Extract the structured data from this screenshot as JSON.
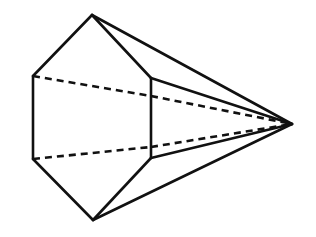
{
  "figure": {
    "title": "Hexagonal pyramid line drawing",
    "kind": "geometric-line-drawing",
    "background_color": "#ffffff",
    "stroke_color": "#111111",
    "stroke_width": 2.6,
    "hidden_edge_dash": "7 5",
    "canvas": {
      "width": 316,
      "height": 237
    },
    "vertices": {
      "top": {
        "name": "top-vertex",
        "x": 92,
        "y": 15
      },
      "upper_left": {
        "name": "upper-left-vertex",
        "x": 33,
        "y": 76
      },
      "lower_left": {
        "name": "lower-left-vertex",
        "x": 33,
        "y": 159
      },
      "bottom": {
        "name": "bottom-vertex",
        "x": 93,
        "y": 220
      },
      "upper_mid": {
        "name": "upper-middle-vertex",
        "x": 151,
        "y": 78
      },
      "lower_mid": {
        "name": "lower-middle-vertex",
        "x": 151,
        "y": 158
      },
      "upper_back": {
        "name": "upper-back-vertex",
        "x": 151,
        "y": 96
      },
      "lower_back": {
        "name": "lower-back-vertex",
        "x": 151,
        "y": 147
      },
      "apex": {
        "name": "apex-vertex",
        "x": 292,
        "y": 124
      }
    },
    "edges": {
      "solid": [
        {
          "name": "edge-top-to-upper-left",
          "path": "M 92 15 L 33 76"
        },
        {
          "name": "edge-left-vertical",
          "path": "M 33 76 L 33 159"
        },
        {
          "name": "edge-lower-left-to-bottom",
          "path": "M 33 159 L 93 220"
        },
        {
          "name": "edge-top-to-upper-mid",
          "path": "M 92 15 L 151 78"
        },
        {
          "name": "edge-middle-vertical",
          "path": "M 151 78 L 151 158"
        },
        {
          "name": "edge-lower-mid-to-bottom",
          "path": "M 151 158 L 93 220"
        },
        {
          "name": "edge-top-to-apex",
          "path": "M 92 15 L 292 124"
        },
        {
          "name": "edge-upper-mid-to-apex",
          "path": "M 151 78 L 292 124"
        },
        {
          "name": "edge-lower-mid-to-apex",
          "path": "M 151 158 L 292 124"
        },
        {
          "name": "edge-bottom-to-apex",
          "path": "M 93 220 L 292 124"
        }
      ],
      "hidden": [
        {
          "name": "hidden-edge-upper-left-to-upper-back",
          "path": "M 33 76 L 151 96"
        },
        {
          "name": "hidden-edge-lower-left-to-lower-back",
          "path": "M 33 159 L 151 147"
        },
        {
          "name": "hidden-edge-upper-back-to-apex",
          "path": "M 151 96 L 292 124"
        },
        {
          "name": "hidden-edge-lower-back-to-apex",
          "path": "M 151 147 L 292 124"
        }
      ]
    }
  }
}
